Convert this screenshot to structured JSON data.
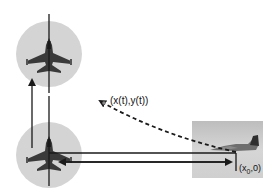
{
  "diagram": {
    "labels": {
      "trajectory_point": "(x(t),y(t))",
      "start_point_prefix": "(x",
      "start_point_sub": "0",
      "start_point_suffix": ",0)"
    },
    "elements": {
      "pursuer_top": "fighter-jet-top-view",
      "pursuer_bottom": "fighter-jet-top-view",
      "target": "aircraft-side-photo"
    },
    "colors": {
      "circle_fill": "#d4d4d4",
      "line": "#222222",
      "photo_bg": "#c9c9c9",
      "background": "#ffffff"
    }
  }
}
